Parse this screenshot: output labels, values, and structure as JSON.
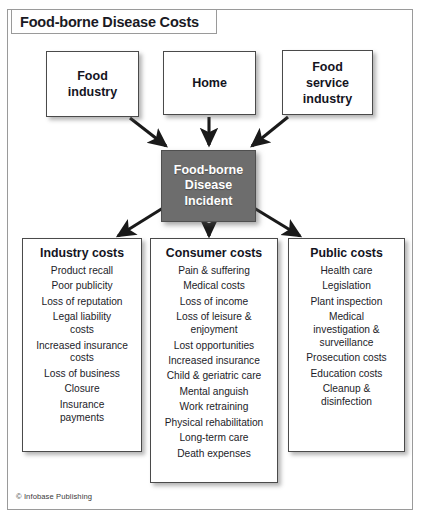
{
  "title": "Food-borne Disease Costs",
  "sources": [
    {
      "id": "food-industry",
      "label": "Food\nindustry"
    },
    {
      "id": "home",
      "label": "Home"
    },
    {
      "id": "food-service",
      "label": "Food\nservice\nindustry"
    }
  ],
  "center": {
    "id": "food-borne-disease-incident",
    "label": "Food-borne\nDisease\nIncident",
    "fill": "#6d6d6d",
    "text_color": "#ffffff"
  },
  "columns": [
    {
      "id": "industry-costs",
      "header": "Industry costs",
      "items": [
        "Product recall",
        "Poor publicity",
        "Loss of reputation",
        "Legal liability\ncosts",
        "Increased insurance\ncosts",
        "Loss of business",
        "Closure",
        "Insurance\npayments"
      ]
    },
    {
      "id": "consumer-costs",
      "header": "Consumer costs",
      "items": [
        "Pain & suffering",
        "Medical costs",
        "Loss of income",
        "Loss of leisure &\nenjoyment",
        "Lost opportunities",
        "Increased insurance",
        "Child & geriatric care",
        "Mental anguish",
        "Work retraining",
        "Physical rehabilitation",
        "Long-term care",
        "Death expenses"
      ]
    },
    {
      "id": "public-costs",
      "header": "Public costs",
      "items": [
        "Health care",
        "Legislation",
        "Plant inspection",
        "Medical\ninvestigation &\nsurveillance",
        "Prosecution costs",
        "Education costs",
        "Cleanup &\ndisinfection"
      ]
    }
  ],
  "credit": "© Infobase Publishing"
}
